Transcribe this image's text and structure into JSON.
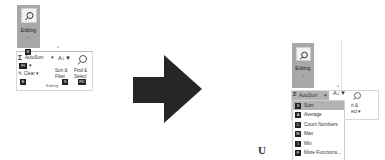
{
  "left": {
    "editing_button": {
      "label": "Editing",
      "icon": "magnifier-icon",
      "caret": "⌄",
      "key": "E"
    },
    "group_label": "Editing",
    "autosum": {
      "label": "AutoSum",
      "caret": "▾",
      "icon": "sigma-icon"
    },
    "fill": {
      "label": "Fill",
      "caret": "▾",
      "key": "FI"
    },
    "clear": {
      "label": "Clear",
      "caret": "▾",
      "key": "E"
    },
    "sort_filter": {
      "label1": "Sort &",
      "label2": "Filter",
      "caret": "▾",
      "key": "S"
    },
    "find_select": {
      "label1": "Find &",
      "label2": "Select",
      "caret": "▾",
      "key": "FD"
    },
    "collapse_caret": "^"
  },
  "arrow": {
    "color": "#262626",
    "icon": "right-arrow-icon"
  },
  "stray_glyph": "U",
  "right": {
    "editing_button": {
      "label": "Editing",
      "icon": "magnifier-icon",
      "caret": "⌄"
    },
    "collapse_caret": "^",
    "autosum": {
      "label": "AutoSum",
      "caret": "▾",
      "icon": "sigma-icon"
    },
    "partial_labels": [
      "rt &",
      "ect ▾"
    ],
    "dropdown": [
      {
        "key": "S",
        "label": "Sum",
        "highlighted": true
      },
      {
        "key": "A",
        "label": "Average",
        "highlighted": false
      },
      {
        "key": "C",
        "label": "Count Numbers",
        "highlighted": false
      },
      {
        "key": "M",
        "label": "Max",
        "highlighted": false
      },
      {
        "key": "I",
        "label": "Min",
        "highlighted": false
      },
      {
        "key": "F",
        "label": "More Functions...",
        "highlighted": false
      }
    ]
  },
  "colors": {
    "button_gray": "#a8a8a8",
    "highlight_gray": "#b3b3b3",
    "key_badge": "#222222"
  }
}
